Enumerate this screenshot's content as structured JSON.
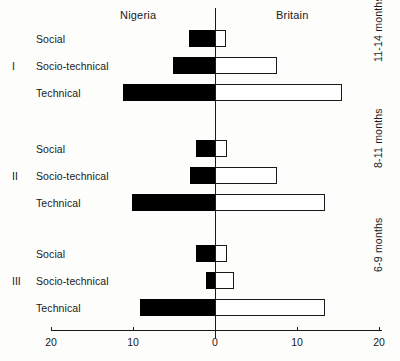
{
  "header": {
    "left_region": "Nigeria",
    "right_region": "Britain"
  },
  "axis": {
    "ticks": [
      {
        "label": "20",
        "value": -20
      },
      {
        "label": "10",
        "value": -10
      },
      {
        "label": "0",
        "value": 0
      },
      {
        "label": "10",
        "value": 10
      },
      {
        "label": "20",
        "value": 20
      }
    ],
    "min": -20,
    "max": 20,
    "zero_value": 0
  },
  "groups": [
    {
      "numeral": "I",
      "age_label": "11-14 months",
      "rows": [
        {
          "label": "Social",
          "nigeria": 3.2,
          "britain": 1.3
        },
        {
          "label": "Socio-technical",
          "nigeria": 5.1,
          "britain": 7.6
        },
        {
          "label": "Technical",
          "nigeria": 11.2,
          "britain": 15.5
        }
      ]
    },
    {
      "numeral": "II",
      "age_label": "8-11 months",
      "rows": [
        {
          "label": "Social",
          "nigeria": 2.3,
          "britain": 1.5
        },
        {
          "label": "Socio-technical",
          "nigeria": 3.0,
          "britain": 7.5
        },
        {
          "label": "Technical",
          "nigeria": 10.1,
          "britain": 13.4
        }
      ]
    },
    {
      "numeral": "III",
      "age_label": "6-9 months",
      "rows": [
        {
          "label": "Social",
          "nigeria": 2.3,
          "britain": 1.5
        },
        {
          "label": "Socio-technical",
          "nigeria": 1.1,
          "britain": 2.3
        },
        {
          "label": "Technical",
          "nigeria": 9.1,
          "britain": 13.4
        }
      ]
    }
  ],
  "colors": {
    "nigeria_fill": "#000000",
    "britain_fill": "#ffffff",
    "stroke": "#1a1a1a",
    "background": "#fdfdfb"
  },
  "chart_data": {
    "type": "bar",
    "orientation": "horizontal",
    "style": "diverging-bidirectional",
    "title": "",
    "subtitle": "",
    "xlabel": "",
    "ylabel": "",
    "xlim": [
      -20,
      20
    ],
    "xticks": [
      -20,
      -10,
      0,
      10,
      20
    ],
    "xticklabels": [
      "20",
      "10",
      "0",
      "10",
      "20"
    ],
    "grid": false,
    "legend": "none",
    "note": "Left side of zero axis is Nigeria (solid black bars); right side is Britain (open/white bars). Values are magnitudes read from the axis.",
    "categories": [
      "I Social",
      "I Socio-technical",
      "I Technical",
      "II Social",
      "II Socio-technical",
      "II Technical",
      "III Social",
      "III Socio-technical",
      "III Technical"
    ],
    "series": [
      {
        "name": "Nigeria",
        "direction": "left",
        "fill": "#000000",
        "values": [
          3.2,
          5.1,
          11.2,
          2.3,
          3.0,
          10.1,
          2.3,
          1.1,
          9.1
        ]
      },
      {
        "name": "Britain",
        "direction": "right",
        "fill": "#ffffff",
        "values": [
          1.3,
          7.6,
          15.5,
          1.5,
          7.5,
          13.4,
          1.5,
          2.3,
          13.4
        ]
      }
    ],
    "group_annotations": [
      {
        "numeral": "I",
        "label": "11-14 months"
      },
      {
        "numeral": "II",
        "label": "8-11 months"
      },
      {
        "numeral": "III",
        "label": "6-9 months"
      }
    ]
  }
}
